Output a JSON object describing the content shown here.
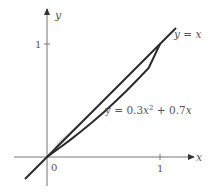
{
  "figure": {
    "type": "region-between-curves",
    "axes": {
      "x_label": "x",
      "y_label": "y",
      "origin_label": "0",
      "x_tick_label": "1",
      "y_tick_label": "1"
    },
    "curves": [
      {
        "name": "line",
        "equation_label": "y = x",
        "lhs": "y = ",
        "rhs": "x"
      },
      {
        "name": "parabola",
        "equation_label": "y = 0.3x² + 0.7x",
        "lhs": "y = 0.3",
        "var": "x",
        "exp": "2",
        "tail": " + 0.7",
        "var2": "x"
      }
    ],
    "shaded_region": {
      "between": [
        "y = x",
        "y = 0.3x² + 0.7x"
      ],
      "x_range": [
        0,
        1
      ],
      "fill": "#cfcfcf"
    },
    "colors": {
      "axis": "#777777",
      "curve": "#2a2a2a",
      "label": "#555555",
      "shade": "#cfcfcf"
    }
  }
}
